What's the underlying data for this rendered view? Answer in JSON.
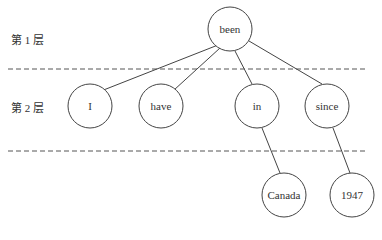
{
  "levels": [
    {
      "label": "第 1 层"
    },
    {
      "label": "第 2 层"
    }
  ],
  "nodes": {
    "root": "been",
    "level2": [
      "I",
      "have",
      "in",
      "since"
    ],
    "level3": [
      "Canada",
      "1947"
    ]
  },
  "colors": {
    "stroke": "#444444",
    "dash": "#555555",
    "text": "#333333"
  }
}
